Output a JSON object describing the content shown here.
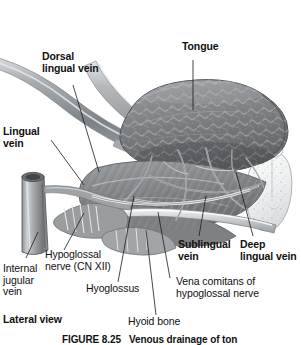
{
  "figure": {
    "view_label": "Lateral view",
    "caption": "FIGURE 8.25",
    "colors": {
      "background": "#ffffff",
      "ink": "#111111",
      "leader_line": "#1a1a1a",
      "tissue_dark": "#6f7275",
      "tissue_mid": "#8e9194",
      "tissue_light": "#b9bcbf",
      "vessel": "#9aa0a4",
      "gland": "#e8e9ea"
    }
  },
  "labels": {
    "tongue": "Tongue",
    "dorsal_lingual_vein": "Dorsal\nlingual vein",
    "lingual_vein": "Lingual\nvein",
    "sublingual_vein": "Sublingual\nvein",
    "deep_lingual_vein": "Deep\nlingual vein",
    "internal_jugular_vein": "Internal\njugular\nvein",
    "hypoglossal_nerve": "Hypoglossal\nnerve (CN XII)",
    "hyoglossus": "Hyoglossus",
    "hyoid_bone": "Hyoid bone",
    "vena_comitans": "Vena comitans of\nhypoglossal nerve",
    "lateral_view": "Lateral view",
    "figure_caption": "FIGURE 8.25   Venous drainage of ton"
  },
  "structures": [
    {
      "name": "tongue",
      "type": "organ",
      "note": "dorsum with papillae texture, upper right"
    },
    {
      "name": "lingual-vein",
      "type": "vessel",
      "note": "large diagonal vein upper left"
    },
    {
      "name": "dorsal-lingual-vein",
      "type": "vessel",
      "note": "branch to tongue dorsum"
    },
    {
      "name": "internal-jugular-vein",
      "type": "vessel",
      "note": "cut cylindrical tube lower left"
    },
    {
      "name": "hyoglossus-muscle",
      "type": "muscle",
      "note": "striated fan below tongue"
    },
    {
      "name": "hyoid-bone",
      "type": "bone",
      "note": "curved band lower centre"
    },
    {
      "name": "hypoglossal-nerve",
      "type": "nerve",
      "note": "CN XII running with vena comitans"
    },
    {
      "name": "sublingual-gland",
      "type": "gland",
      "note": "stippled pale mass right edge"
    },
    {
      "name": "deep-lingual-vein",
      "type": "vessel",
      "note": "vein along under-surface of tongue"
    },
    {
      "name": "sublingual-vein",
      "type": "vessel",
      "note": "vein below hyoglossus"
    }
  ]
}
